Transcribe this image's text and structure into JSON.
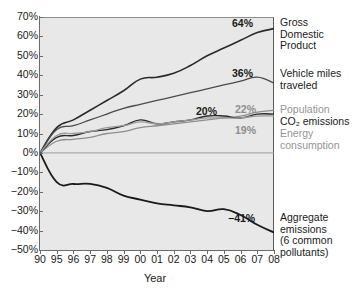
{
  "chart_data": {
    "type": "line",
    "title": "",
    "xlabel": "Year",
    "ylabel": "",
    "grid": false,
    "legend_position": "right-of-plot",
    "xlim": [
      1990,
      2008
    ],
    "ylim": [
      -50,
      70
    ],
    "x_tick_labels": [
      "90",
      "95",
      "96",
      "97",
      "98",
      "99",
      "00",
      "01",
      "02",
      "03",
      "04",
      "05",
      "06",
      "07",
      "08"
    ],
    "x_tick_years": [
      1990,
      1995,
      1996,
      1997,
      1998,
      1999,
      2000,
      2001,
      2002,
      2003,
      2004,
      2005,
      2006,
      2007,
      2008
    ],
    "y_tick_labels": [
      "70%",
      "60%",
      "50%",
      "40%",
      "30%",
      "20%",
      "10%",
      "0%",
      "−10%",
      "−20%",
      "−30%",
      "−40%",
      "−50%"
    ],
    "y_tick_values": [
      70,
      60,
      50,
      40,
      30,
      20,
      10,
      0,
      -10,
      -20,
      -30,
      -40,
      -50
    ],
    "x": [
      1990,
      1995,
      1996,
      1997,
      1998,
      1999,
      2000,
      2001,
      2002,
      2003,
      2004,
      2005,
      2006,
      2007,
      2008
    ],
    "series": [
      {
        "name": "Gross Domestic Product",
        "label_lines": [
          "Gross",
          "Domestic",
          "Product"
        ],
        "end_label": "64%",
        "color": "#2a2a2a",
        "width": 1.6,
        "label_color": "dark",
        "values": [
          0,
          13,
          17,
          22,
          27,
          32,
          38,
          39,
          41,
          45,
          50,
          54,
          58,
          62,
          64
        ]
      },
      {
        "name": "Vehicle miles traveled",
        "label_lines": [
          "Vehicle miles",
          "traveled"
        ],
        "end_label": "36%",
        "color": "#4a4a4a",
        "width": 1.3,
        "label_color": "dark",
        "values": [
          0,
          12,
          14,
          17,
          20,
          23,
          25,
          27,
          29,
          31,
          33,
          35,
          37,
          39,
          36
        ]
      },
      {
        "name": "Population",
        "label_lines": [
          "Population"
        ],
        "end_label": "22%",
        "color": "#8e8e8e",
        "width": 1.3,
        "label_color": "gray",
        "values": [
          0,
          6,
          7,
          8,
          10,
          11,
          13,
          14,
          15,
          16,
          17,
          18,
          19,
          21,
          22
        ]
      },
      {
        "name": "CO2 emissions",
        "label_lines": [
          "CO₂ emissions"
        ],
        "end_label": "20%",
        "color": "#2a2a2a",
        "width": 1.4,
        "label_color": "dark",
        "values": [
          0,
          8,
          9,
          11,
          12,
          14,
          17,
          15,
          16,
          17,
          19,
          19,
          18,
          20,
          20
        ]
      },
      {
        "name": "Energy consumption",
        "label_lines": [
          "Energy",
          "consumption"
        ],
        "end_label": "19%",
        "color": "#9a9a9a",
        "width": 1.3,
        "label_color": "gray",
        "values": [
          0,
          9,
          10,
          11,
          13,
          14,
          16,
          15,
          16,
          17,
          18,
          18,
          18,
          19,
          19
        ]
      },
      {
        "name": "Aggregate emissions (6 common pollutants)",
        "label_lines": [
          "Aggregate",
          "emissions",
          "(6 common",
          "pollutants)"
        ],
        "end_label": "−41%",
        "color": "#1a1a1a",
        "width": 1.8,
        "label_color": "dark",
        "values": [
          0,
          -15,
          -16,
          -16,
          -18,
          -22,
          -24,
          -26,
          -27,
          -28,
          -30,
          -29,
          -32,
          -37,
          -41
        ]
      }
    ],
    "zero_line": 0
  },
  "callouts": [
    {
      "text": "64%",
      "tone": "dark",
      "left": 232,
      "top": 18
    },
    {
      "text": "36%",
      "tone": "dark",
      "left": 232,
      "top": 68
    },
    {
      "text": "20%",
      "tone": "dark",
      "left": 196,
      "top": 106
    },
    {
      "text": "22%",
      "tone": "gray",
      "left": 235,
      "top": 104
    },
    {
      "text": "19%",
      "tone": "gray",
      "left": 235,
      "top": 125
    },
    {
      "text": "−41%",
      "tone": "dark",
      "left": 228,
      "top": 213
    }
  ],
  "series_labels": [
    {
      "lines": [
        "Gross",
        "Domestic",
        "Product"
      ],
      "tone": "dark",
      "left": 280,
      "top": 17
    },
    {
      "lines": [
        "Vehicle miles",
        "traveled"
      ],
      "tone": "dark",
      "left": 280,
      "top": 68
    },
    {
      "lines": [
        "Population"
      ],
      "tone": "gray",
      "left": 280,
      "top": 104
    },
    {
      "lines": [
        "CO₂ emissions"
      ],
      "tone": "dark",
      "left": 280,
      "top": 116
    },
    {
      "lines": [
        "Energy",
        "consumption"
      ],
      "tone": "gray",
      "left": 280,
      "top": 128
    },
    {
      "lines": [
        "Aggregate",
        "emissions",
        "(6 common",
        "pollutants)"
      ],
      "tone": "dark",
      "left": 280,
      "top": 212
    }
  ]
}
